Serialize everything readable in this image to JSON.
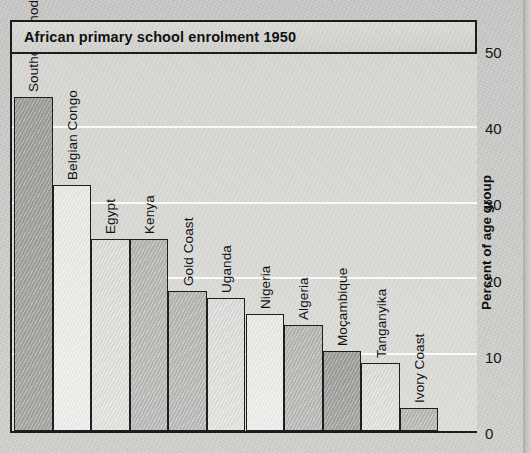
{
  "title": "African primary school enrolment 1950",
  "axis": {
    "y_title": "Percent of age group",
    "ticks": [
      "50",
      "40",
      "30",
      "20",
      "10",
      "0"
    ]
  },
  "chart_data": {
    "type": "bar",
    "title": "African primary school enrolment 1950",
    "xlabel": "",
    "ylabel": "Percent of age group",
    "ylim": [
      0,
      50
    ],
    "yticks": [
      0,
      10,
      20,
      30,
      40,
      50
    ],
    "grid": true,
    "legend": "none",
    "orientation": "vertical",
    "label_rotation": -90,
    "categories": [
      "Southern Rhodesia",
      "Belgian Congo",
      "Egypt",
      "Kenya",
      "Gold Coast",
      "Uganda",
      "Nigeria",
      "Algeria",
      "Moçambique",
      "Tanganyika",
      "Ivory Coast"
    ],
    "values": [
      44,
      32.5,
      25.3,
      25.3,
      18.5,
      17.5,
      15.5,
      14,
      10.5,
      9,
      3
    ],
    "bars": [
      {
        "label": "Southern Rhodesia",
        "value": 44,
        "shade": "sh-dark"
      },
      {
        "label": "Belgian Congo",
        "value": 32.5,
        "shade": "sh-vlight"
      },
      {
        "label": "Egypt",
        "value": 25.3,
        "shade": "sh-light"
      },
      {
        "label": "Kenya",
        "value": 25.3,
        "shade": "sh-mid"
      },
      {
        "label": "Gold Coast",
        "value": 18.5,
        "shade": "sh-mid"
      },
      {
        "label": "Uganda",
        "value": 17.5,
        "shade": "sh-light"
      },
      {
        "label": "Nigeria",
        "value": 15.5,
        "shade": "sh-vlight"
      },
      {
        "label": "Algeria",
        "value": 14,
        "shade": "sh-mid"
      },
      {
        "label": "Moçambique",
        "value": 10.5,
        "shade": "sh-dark"
      },
      {
        "label": "Tanganyika",
        "value": 9,
        "shade": "sh-light"
      },
      {
        "label": "Ivory Coast",
        "value": 3,
        "shade": "sh-mid"
      }
    ]
  }
}
